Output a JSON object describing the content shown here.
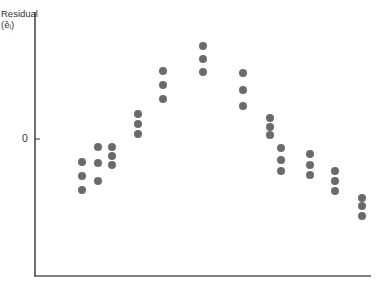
{
  "chart_data": {
    "type": "scatter",
    "title": "",
    "xlabel": "",
    "ylabel": "Residual (ê_i)",
    "ylabel_line1": "Residual",
    "ylabel_line2": "(êᵢ)",
    "yticks": [
      {
        "label": "0",
        "value": 0
      }
    ],
    "xticks": [],
    "grid": false,
    "legend": null,
    "point_color": "#6b6b6b",
    "axis_color": "#333333",
    "clusters": [
      {
        "x": 1,
        "residuals": [
          -0.36,
          -0.56,
          -0.76
        ]
      },
      {
        "x": 2,
        "residuals": [
          -0.14,
          -0.37,
          -0.63
        ]
      },
      {
        "x": 3,
        "residuals": [
          -0.14,
          -0.27,
          -0.4
        ]
      },
      {
        "x": 4,
        "residuals": [
          0.36,
          0.21,
          0.07
        ]
      },
      {
        "x": 5,
        "residuals": [
          0.97,
          0.77,
          0.57
        ]
      },
      {
        "x": 6,
        "residuals": [
          1.34,
          1.16,
          0.97
        ]
      },
      {
        "x": 7,
        "residuals": [
          0.96,
          0.71,
          0.47
        ]
      },
      {
        "x": 8,
        "residuals": [
          0.3,
          0.17,
          0.06
        ]
      },
      {
        "x": 9,
        "residuals": [
          -0.14,
          -0.31,
          -0.47
        ]
      },
      {
        "x": 10,
        "residuals": [
          -0.23,
          -0.39,
          -0.53
        ]
      },
      {
        "x": 11,
        "residuals": [
          -0.47,
          -0.61,
          -0.76
        ]
      },
      {
        "x": 12,
        "residuals": [
          -0.86,
          -0.97,
          -1.11
        ]
      }
    ],
    "points_px": [
      [
        82,
        162
      ],
      [
        82,
        176
      ],
      [
        82,
        190
      ],
      [
        98,
        147
      ],
      [
        98,
        163
      ],
      [
        98,
        181
      ],
      [
        112,
        147
      ],
      [
        112,
        156
      ],
      [
        112,
        165
      ],
      [
        138,
        114
      ],
      [
        138,
        124
      ],
      [
        138,
        134
      ],
      [
        163,
        71
      ],
      [
        163,
        85
      ],
      [
        163,
        99
      ],
      [
        203,
        46
      ],
      [
        203,
        59
      ],
      [
        203,
        72
      ],
      [
        243,
        73
      ],
      [
        243,
        90
      ],
      [
        243,
        106
      ],
      [
        270,
        118
      ],
      [
        270,
        127
      ],
      [
        270,
        135
      ],
      [
        281,
        148
      ],
      [
        281,
        160
      ],
      [
        281,
        171
      ],
      [
        310,
        154
      ],
      [
        310,
        165
      ],
      [
        310,
        175
      ],
      [
        335,
        171
      ],
      [
        335,
        181
      ],
      [
        335,
        191
      ],
      [
        362,
        198
      ],
      [
        362,
        206
      ],
      [
        362,
        216
      ]
    ]
  }
}
